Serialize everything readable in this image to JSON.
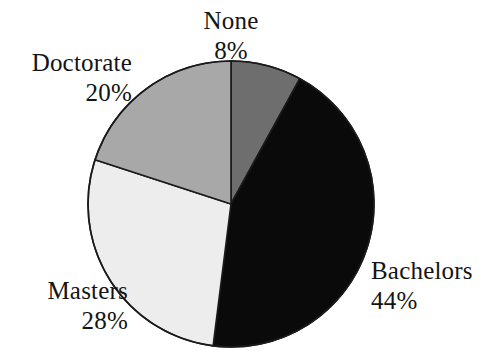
{
  "chart_data": {
    "type": "pie",
    "title": "",
    "subtitle": "",
    "xlabel": "",
    "ylabel": "",
    "legend_position": "none",
    "grid": false,
    "labels_outside": true,
    "start_angle_deg": 0,
    "direction": "clockwise",
    "categories": [
      "None",
      "Bachelors",
      "Masters",
      "Doctorate"
    ],
    "values": [
      8,
      44,
      28,
      20
    ],
    "value_unit": "%",
    "slices": [
      {
        "label": "None",
        "value": 8,
        "percent_text": "8%",
        "color": "#6e6e6e",
        "start_deg": 0,
        "end_deg": 28.8
      },
      {
        "label": "Bachelors",
        "value": 44,
        "percent_text": "44%",
        "color": "#0a0a0a",
        "start_deg": 28.8,
        "end_deg": 187.2
      },
      {
        "label": "Masters",
        "value": 28,
        "percent_text": "28%",
        "color": "#ededed",
        "start_deg": 187.2,
        "end_deg": 288.0
      },
      {
        "label": "Doctorate",
        "value": 20,
        "percent_text": "20%",
        "color": "#a8a8a8",
        "start_deg": 288.0,
        "end_deg": 360.0
      }
    ],
    "geometry": {
      "center_x": 231,
      "center_y": 204,
      "radius": 143
    },
    "style": {
      "background": "#ffffff",
      "outline_color": "#1a1a1a",
      "outline_width": 1.6,
      "text_color": "#141414"
    }
  }
}
